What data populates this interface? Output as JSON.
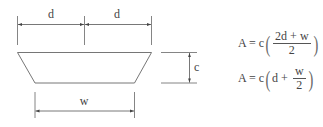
{
  "diagram": {
    "title": "",
    "labels": {
      "d_left": "d",
      "d_right": "d",
      "c": "c",
      "w": "w"
    },
    "formulas": [
      {
        "lhs": "A = c",
        "open": "(",
        "numerator": "2d + w",
        "denominator": "2",
        "close": ")"
      },
      {
        "lhs": "A = c",
        "open": "(",
        "prefix": "d +",
        "numerator": "w",
        "denominator": "2",
        "close": ")"
      }
    ],
    "colors": {
      "line": "#555555",
      "text": "#444444",
      "background": "#ffffff"
    }
  }
}
